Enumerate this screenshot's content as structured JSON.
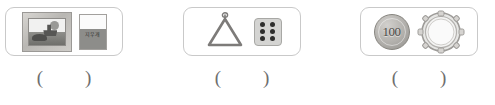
{
  "worksheet": {
    "groups": [
      {
        "id": "group-1",
        "objects": [
          {
            "name": "framed-picture",
            "label": "framed picture"
          },
          {
            "name": "cup",
            "label": "cup",
            "text": "지우개"
          }
        ],
        "answer": {
          "open": "(",
          "close": ")",
          "value": ""
        }
      },
      {
        "id": "group-2",
        "objects": [
          {
            "name": "triangle-instrument",
            "label": "triangle"
          },
          {
            "name": "die",
            "label": "die",
            "pips": 6
          }
        ],
        "answer": {
          "open": "(",
          "close": ")",
          "value": ""
        }
      },
      {
        "id": "group-3",
        "objects": [
          {
            "name": "coin",
            "label": "coin",
            "text": "100"
          },
          {
            "name": "drum",
            "label": "drum"
          }
        ],
        "answer": {
          "open": "(",
          "close": ")",
          "value": ""
        }
      }
    ],
    "colors": {
      "panel_border": "#c9c9c9",
      "paren": "#6e6e6e",
      "background": "#ffffff"
    }
  }
}
